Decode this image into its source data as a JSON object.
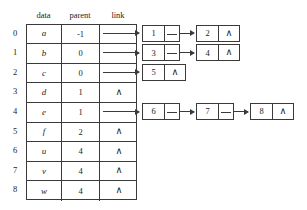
{
  "diagram": {
    "colors": {
      "ink": "#1d1d1d",
      "rule": "#3a3a3a",
      "background": "#ffffff"
    },
    "headers": {
      "data": "data",
      "parent": "parent",
      "link": "link"
    },
    "null_symbol": "∧",
    "rows": [
      {
        "index": "0",
        "data": "a",
        "parent": "-1",
        "link": "arrow",
        "children": [
          "1",
          "2"
        ]
      },
      {
        "index": "1",
        "data": "b",
        "parent": "0",
        "link": "arrow",
        "children": [
          "3",
          "4"
        ]
      },
      {
        "index": "2",
        "data": "c",
        "parent": "0",
        "link": "arrow",
        "children": [
          "5"
        ]
      },
      {
        "index": "3",
        "data": "d",
        "parent": "1",
        "link": "null",
        "children": []
      },
      {
        "index": "4",
        "data": "e",
        "parent": "1",
        "link": "arrow",
        "children": [
          "6",
          "7",
          "8"
        ]
      },
      {
        "index": "5",
        "data": "f",
        "parent": "2",
        "link": "null",
        "children": []
      },
      {
        "index": "6",
        "data": "u",
        "parent": "4",
        "link": "null",
        "children": []
      },
      {
        "index": "7",
        "data": "v",
        "parent": "4",
        "link": "null",
        "children": []
      },
      {
        "index": "8",
        "data": "w",
        "parent": "4",
        "link": "null",
        "children": []
      }
    ],
    "lists": [
      {
        "row": "0",
        "nodes": [
          {
            "value": "1",
            "next": "link"
          },
          {
            "value": "2",
            "next": "null"
          }
        ]
      },
      {
        "row": "1",
        "nodes": [
          {
            "value": "3",
            "next": "link"
          },
          {
            "value": "4",
            "next": "null"
          }
        ]
      },
      {
        "row": "2",
        "nodes": [
          {
            "value": "5",
            "next": "null"
          }
        ]
      },
      {
        "row": "4",
        "nodes": [
          {
            "value": "6",
            "next": "link"
          },
          {
            "value": "7",
            "next": "link"
          },
          {
            "value": "8",
            "next": "null"
          }
        ]
      }
    ]
  }
}
